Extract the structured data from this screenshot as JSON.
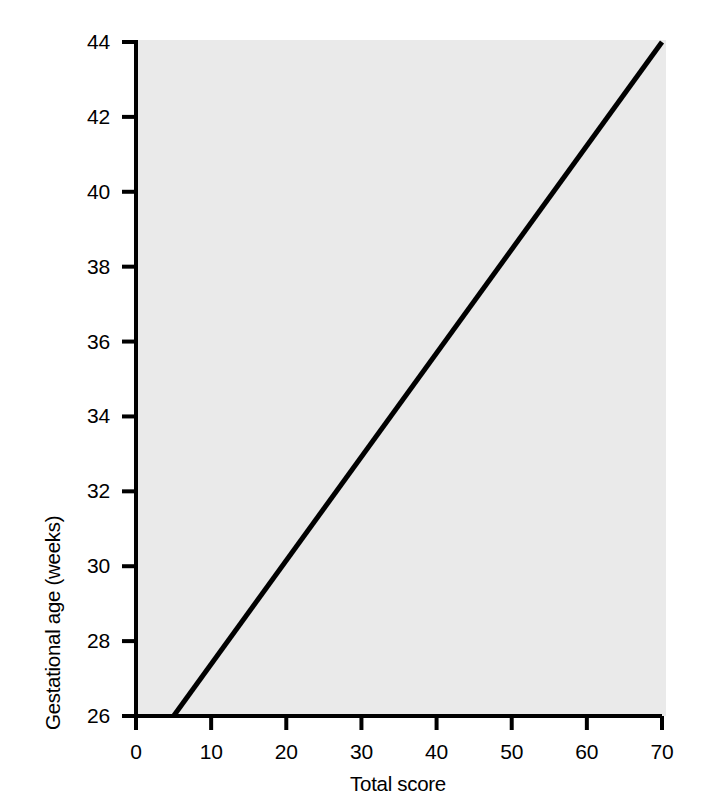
{
  "chart_data": {
    "type": "line",
    "title": "",
    "subtitle": "",
    "xlabel": "Total score",
    "ylabel": "Gestational age (weeks)",
    "xlim": [
      0,
      70
    ],
    "ylim": [
      26,
      44
    ],
    "xticks": [
      0,
      10,
      20,
      30,
      40,
      50,
      60,
      70
    ],
    "yticks": [
      26,
      28,
      30,
      32,
      34,
      36,
      38,
      40,
      42,
      44
    ],
    "xtick_labels": [
      "0",
      "10",
      "20",
      "30",
      "40",
      "50",
      "60",
      "70"
    ],
    "ytick_labels": [
      "26",
      "28",
      "30",
      "32",
      "34",
      "36",
      "38",
      "40",
      "42",
      "44"
    ],
    "grid": false,
    "legend": null,
    "legend_position": "none",
    "plot_background": "#eaeaea",
    "line_color": "#000000",
    "line_width_px": 5,
    "series": [
      {
        "name": "Gestational age vs total score",
        "x": [
          5,
          10,
          20,
          30,
          40,
          50,
          60,
          70
        ],
        "y": [
          26.0,
          27.38,
          30.15,
          32.92,
          35.69,
          38.46,
          41.23,
          44.0
        ],
        "endpoints": [
          [
            5,
            26
          ],
          [
            70,
            44
          ]
        ],
        "slope_weeks_per_point": 0.2769,
        "intercept_weeks": 24.615
      }
    ],
    "annotations": []
  },
  "axes": {
    "y_title": "Gestational age (weeks)",
    "x_title": "Total score"
  },
  "colors": {
    "page_background": "#ffffff",
    "plot_area": "#eaeaea",
    "axis": "#000000",
    "line": "#000000",
    "text": "#000000"
  }
}
